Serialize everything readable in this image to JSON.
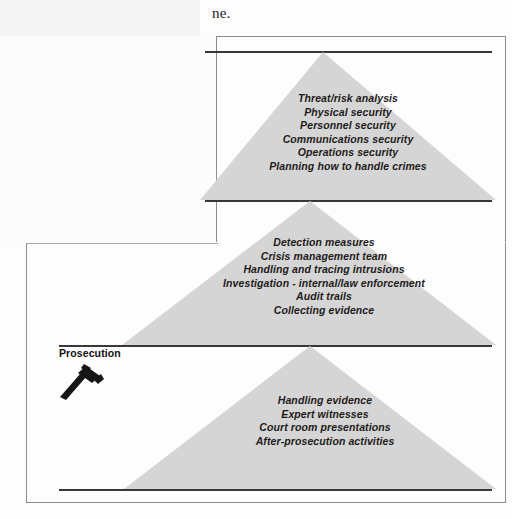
{
  "page": {
    "top_text_fragment": "ne."
  },
  "diagram": {
    "title_hidden": "",
    "colors": {
      "triangle_fill": "#d5d5d5",
      "rule": "#3a3836",
      "frame": "#8d8d8d",
      "text": "#1d1b1a"
    },
    "tiers": [
      {
        "id": "tier-1",
        "name": "prevention-tier",
        "lines": [
          "Threat/risk analysis",
          "Physical security",
          "Personnel security",
          "Communications security",
          "Operations security",
          "Planning how to handle crimes"
        ]
      },
      {
        "id": "tier-2",
        "name": "detection-investigation-tier",
        "lines": [
          "Detection measures",
          "Crisis management team",
          "Handling and tracing intrusions",
          "Investigation - internal/law enforcement",
          "Audit trails",
          "Collecting evidence"
        ]
      },
      {
        "id": "tier-3",
        "name": "prosecution-tier",
        "lines": [
          "Handling evidence",
          "Expert witnesses",
          "Court room presentations",
          "After-prosecution activities"
        ]
      }
    ],
    "annotations": [
      {
        "id": "prosecution",
        "label": "Prosecution",
        "icon": "gavel-icon"
      }
    ]
  }
}
